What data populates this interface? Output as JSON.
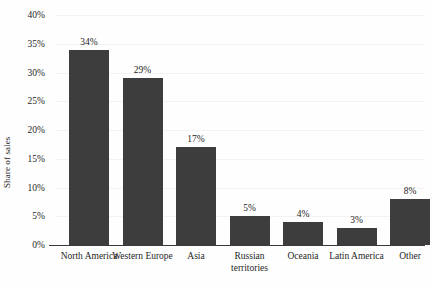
{
  "chart_data": {
    "type": "bar",
    "title": "",
    "subtitle": "",
    "xlabel": "",
    "ylabel": "Share of sales",
    "ylim": [
      0,
      40
    ],
    "ytick_labels": [
      "0%",
      "5%",
      "10%",
      "15%",
      "20%",
      "25%",
      "30%",
      "35%",
      "40%"
    ],
    "ytick_values": [
      0,
      5,
      10,
      15,
      20,
      25,
      30,
      35,
      40
    ],
    "grid": true,
    "legend": "none",
    "categories": [
      "North America",
      "Western Europe",
      "Asia",
      "Russian territories",
      "Oceania",
      "Latin America",
      "Other"
    ],
    "values": [
      34,
      29,
      17,
      5,
      4,
      3,
      8
    ],
    "data_labels": [
      "34%",
      "29%",
      "17%",
      "5%",
      "4%",
      "3%",
      "8%"
    ],
    "bar_color": "#3d3d3d",
    "background_color": "#fefefe",
    "axis_color": "#3a3a3a"
  }
}
